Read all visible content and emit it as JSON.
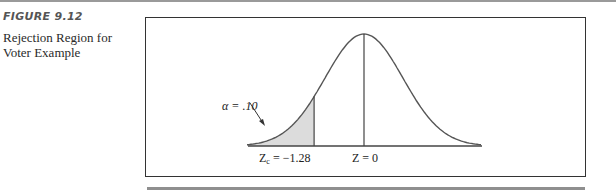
{
  "figure": {
    "number_label": "FIGURE 9.12",
    "caption": "Rejection Region for Voter Example"
  },
  "chart_data": {
    "type": "area",
    "title": "Rejection Region for Voter Example",
    "distribution": "standard normal",
    "x_range": [
      -3,
      3
    ],
    "shaded_region": {
      "from": "-inf",
      "to": -1.28,
      "area": 0.1
    },
    "annotations": [
      {
        "text": "α = .10",
        "points_to": "shaded left tail"
      },
      {
        "text": "Zc = −1.28",
        "x": -1.28
      },
      {
        "text": "Z = 0",
        "x": 0
      }
    ],
    "vertical_lines": [
      -1.28,
      0
    ],
    "grid": false,
    "legend": null
  },
  "labels": {
    "alpha": "α = .10",
    "zc_main": "Z",
    "zc_sub": "c",
    "zc_value": " = −1.28",
    "z0": "Z = 0"
  }
}
